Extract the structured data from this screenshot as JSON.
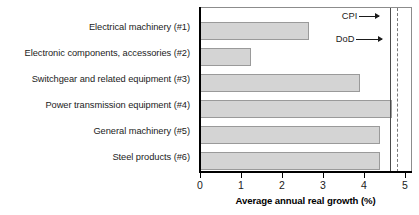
{
  "chart_data": {
    "type": "bar",
    "orientation": "horizontal",
    "title": "",
    "xlabel": "Average annual real growth (%)",
    "ylabel": "",
    "xlim": [
      0,
      5
    ],
    "ylim": null,
    "grid": false,
    "legend": "none",
    "xticks": [
      0,
      1,
      2,
      3,
      4,
      5
    ],
    "xticklabels": [
      "0",
      "1",
      "2",
      "3",
      "4",
      "5"
    ],
    "categories": [
      "Electrical machinery (#1)",
      "Electronic components, accessories (#2)",
      "Switchgear and related equipment (#3)",
      "Power transmission equipment (#4)",
      "General machinery (#5)",
      "Steel products (#6)"
    ],
    "values": [
      2.65,
      1.24,
      3.9,
      4.68,
      4.4,
      4.4
    ],
    "bar_fill_color": "#d4d4d4",
    "bar_edge_color": "#9a9a9a",
    "reference_lines": [
      {
        "label": "CPI",
        "value": 4.63,
        "style": "solid",
        "color": "#4a4a4a"
      },
      {
        "label": "DoD",
        "value": 4.8,
        "style": "dashed",
        "color": "#7a7a7a"
      }
    ]
  },
  "axis": {
    "xlabel": "Average annual real growth (%)"
  }
}
